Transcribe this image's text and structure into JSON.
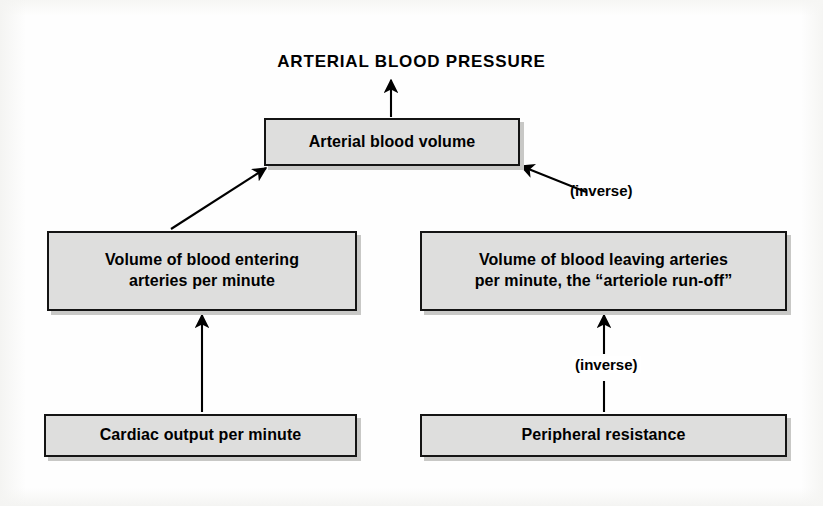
{
  "diagram": {
    "title": "ARTERIAL BLOOD PRESSURE",
    "type": "flow-diagram",
    "background_color": "#ffffff",
    "node_fill_color": "#dededd",
    "node_border_color": "#141414",
    "arrow_color": "#000000",
    "nodes": [
      {
        "id": "arterial-blood-volume",
        "label": "Arterial blood volume",
        "x": 264,
        "y": 118,
        "w": 256,
        "h": 48
      },
      {
        "id": "volume-entering",
        "label": "Volume of blood entering\narteries per minute",
        "line1": "Volume of blood entering",
        "line2": "arteries per minute",
        "x": 47,
        "y": 231,
        "w": 310,
        "h": 80
      },
      {
        "id": "volume-leaving",
        "label": "Volume of blood leaving arteries\nper minute, the “arteriole run-off”",
        "line1": "Volume of blood leaving arteries",
        "line2": "per minute, the “arteriole run-off”",
        "x": 420,
        "y": 231,
        "w": 367,
        "h": 80
      },
      {
        "id": "cardiac-output",
        "label": "Cardiac output per minute",
        "x": 44,
        "y": 414,
        "w": 313,
        "h": 43
      },
      {
        "id": "peripheral-resistance",
        "label": "Peripheral resistance",
        "x": 420,
        "y": 414,
        "w": 367,
        "h": 43
      }
    ],
    "edges": [
      {
        "id": "edge-volume-to-abp",
        "from": "arterial-blood-volume",
        "to": "ARTERIAL BLOOD PRESSURE",
        "style": "straight-vertical-arrow",
        "label": ""
      },
      {
        "id": "edge-entering-to-volume",
        "from": "volume-entering",
        "to": "arterial-blood-volume",
        "style": "diagonal-arrow",
        "label": ""
      },
      {
        "id": "edge-leaving-to-volume",
        "from": "volume-leaving",
        "to": "arterial-blood-volume",
        "style": "diagonal-arrow-with-label",
        "label": "(inverse)"
      },
      {
        "id": "edge-cardiac-to-entering",
        "from": "cardiac-output",
        "to": "volume-entering",
        "style": "straight-vertical-arrow",
        "label": ""
      },
      {
        "id": "edge-resistance-to-leaving",
        "from": "peripheral-resistance",
        "to": "volume-leaving",
        "style": "straight-vertical-arrow-with-label",
        "label": "(inverse)"
      }
    ],
    "labels": {
      "inverse_right_upper": "(inverse)",
      "inverse_right_lower": "(inverse)"
    }
  }
}
